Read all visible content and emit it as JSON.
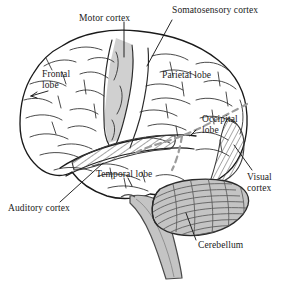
{
  "figure": {
    "type": "anatomical-diagram",
    "background_color": "#ffffff",
    "outline_color": "#1a1a1a",
    "shade_color": "#c9c9c9",
    "dashed_color": "#9a9a9a",
    "text_color": "#1a1a1a"
  },
  "labels": {
    "motor_cortex": "Motor cortex",
    "somatosensory_cortex": "Somatosensory cortex",
    "frontal_lobe_line1": "Frontal",
    "frontal_lobe_line2": "lobe",
    "parietal_lobe": "Parietal lobe",
    "occipital_lobe_line1": "Occipital",
    "occipital_lobe_line2": "lobe",
    "visual_cortex_line1": "Visual",
    "visual_cortex_line2": "cortex",
    "temporal_lobe": "Temporal lobe",
    "auditory_cortex": "Auditory cortex",
    "cerebellum": "Cerebellum"
  },
  "regions": [
    {
      "name": "motor-cortex",
      "label": "Motor cortex",
      "fill": "solid-gray",
      "leader": true
    },
    {
      "name": "somatosensory-cortex",
      "label": "Somatosensory cortex",
      "fill": "none",
      "leader": true
    },
    {
      "name": "frontal-lobe",
      "label": "Frontal lobe",
      "fill": "none",
      "leader": true
    },
    {
      "name": "parietal-lobe",
      "label": "Parietal lobe",
      "fill": "none",
      "leader": false
    },
    {
      "name": "occipital-lobe",
      "label": "Occipital lobe",
      "fill": "none",
      "leader": false
    },
    {
      "name": "visual-cortex",
      "label": "Visual cortex",
      "fill": "hatched",
      "leader": true
    },
    {
      "name": "temporal-lobe",
      "label": "Temporal lobe",
      "fill": "none",
      "leader": false
    },
    {
      "name": "auditory-cortex",
      "label": "Auditory cortex",
      "fill": "hatched",
      "leader": true
    },
    {
      "name": "cerebellum",
      "label": "Cerebellum",
      "fill": "striated-gray",
      "leader": true
    },
    {
      "name": "brainstem",
      "label": "",
      "fill": "solid-gray",
      "leader": false
    }
  ]
}
